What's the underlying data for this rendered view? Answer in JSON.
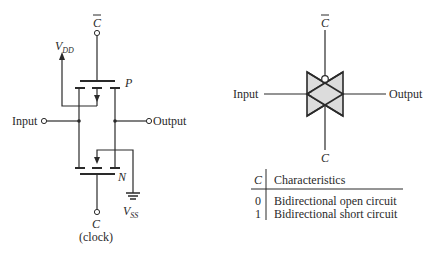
{
  "left_circuit": {
    "gate_top_label": "C",
    "gate_top_bar": true,
    "vdd_label": "V",
    "vdd_sub": "DD",
    "p_label": "P",
    "n_label": "N",
    "input_label": "Input",
    "output_label": "Output",
    "vss_label": "V",
    "vss_sub": "SS",
    "gate_bottom_label": "C",
    "clock_label": "(clock)"
  },
  "right_symbol": {
    "top_label": "C",
    "input_label": "Input",
    "output_label": "Output",
    "bottom_label": "C",
    "fill_color": "#dcdcdc"
  },
  "table": {
    "headers": [
      "C",
      "Characteristics"
    ],
    "rows": [
      {
        "c": "0",
        "text": "Bidirectional open circuit"
      },
      {
        "c": "1",
        "text": "Bidirectional short circuit"
      }
    ]
  }
}
